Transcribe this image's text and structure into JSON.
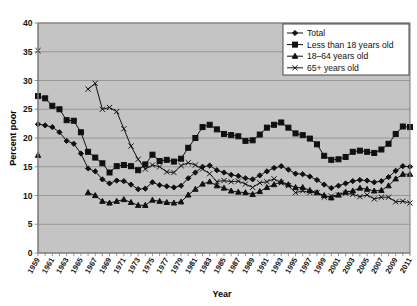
{
  "chart_data": {
    "type": "line",
    "title": "",
    "xlabel": "Year",
    "ylabel": "Percent poor",
    "ylim": [
      0,
      40
    ],
    "ytick_step": 5,
    "yticks": [
      0,
      5,
      10,
      15,
      20,
      25,
      30,
      35,
      40
    ],
    "xlim": [
      1959,
      2011
    ],
    "grid": "horizontal",
    "legend_position": "top-right",
    "plot_background": "#c4c4c4",
    "x": [
      1959,
      1960,
      1961,
      1962,
      1963,
      1964,
      1965,
      1966,
      1967,
      1968,
      1969,
      1970,
      1971,
      1972,
      1973,
      1974,
      1975,
      1976,
      1977,
      1978,
      1979,
      1980,
      1981,
      1982,
      1983,
      1984,
      1985,
      1986,
      1987,
      1988,
      1989,
      1990,
      1991,
      1992,
      1993,
      1994,
      1995,
      1996,
      1997,
      1998,
      1999,
      2000,
      2001,
      2002,
      2003,
      2004,
      2005,
      2006,
      2007,
      2008,
      2009,
      2010,
      2011
    ],
    "xtick_labels": [
      "1959",
      "1961",
      "1963",
      "1965",
      "1967",
      "1969",
      "1971",
      "1973",
      "1975",
      "1977",
      "1979",
      "1981",
      "1983",
      "1985",
      "1987",
      "1989",
      "1991",
      "1993",
      "1995",
      "1997",
      "1999",
      "2001",
      "2003",
      "2005",
      "2007",
      "2009",
      "2011"
    ],
    "series": [
      {
        "name": "Total",
        "marker": "diamond",
        "values": [
          22.4,
          22.2,
          21.9,
          21.0,
          19.5,
          19.0,
          17.3,
          14.7,
          14.2,
          12.8,
          12.1,
          12.6,
          12.5,
          11.9,
          11.1,
          11.2,
          12.3,
          11.8,
          11.6,
          11.4,
          11.7,
          13.0,
          14.0,
          15.0,
          15.2,
          14.4,
          14.0,
          13.6,
          13.4,
          13.0,
          12.8,
          13.5,
          14.2,
          14.8,
          15.1,
          14.5,
          13.8,
          13.7,
          13.3,
          12.7,
          11.9,
          11.3,
          11.7,
          12.1,
          12.5,
          12.7,
          12.6,
          12.3,
          12.5,
          13.2,
          14.3,
          15.1,
          15.0
        ]
      },
      {
        "name": "Less than 18 years old",
        "marker": "square",
        "values": [
          27.3,
          26.9,
          25.6,
          25.0,
          23.1,
          23.0,
          21.0,
          17.6,
          16.6,
          15.6,
          14.0,
          15.1,
          15.3,
          15.1,
          14.4,
          15.4,
          17.1,
          16.0,
          16.2,
          15.9,
          16.4,
          18.3,
          20.0,
          21.9,
          22.3,
          21.5,
          20.7,
          20.5,
          20.3,
          19.5,
          19.6,
          20.6,
          21.8,
          22.3,
          22.7,
          21.8,
          20.8,
          20.5,
          19.9,
          18.9,
          16.9,
          16.2,
          16.3,
          16.7,
          17.6,
          17.8,
          17.6,
          17.4,
          18.0,
          19.0,
          20.7,
          22.0,
          21.9
        ]
      },
      {
        "name": "18–64 years old",
        "marker": "triangle",
        "values": [
          17.0,
          null,
          null,
          null,
          null,
          null,
          null,
          10.5,
          10.0,
          9.0,
          8.7,
          9.0,
          9.3,
          8.8,
          8.3,
          8.3,
          9.2,
          9.0,
          8.8,
          8.7,
          8.9,
          10.1,
          11.1,
          12.0,
          12.4,
          11.7,
          11.3,
          10.8,
          10.6,
          10.5,
          10.2,
          10.7,
          11.4,
          11.9,
          12.4,
          11.9,
          11.4,
          11.4,
          10.9,
          10.5,
          10.0,
          9.6,
          10.1,
          10.6,
          10.8,
          11.3,
          11.1,
          10.8,
          10.9,
          11.7,
          12.9,
          13.7,
          13.7
        ]
      },
      {
        "name": "65+ years old",
        "marker": "x",
        "values": [
          35.2,
          null,
          null,
          null,
          null,
          null,
          null,
          28.5,
          29.5,
          25.0,
          25.3,
          24.6,
          21.6,
          18.6,
          16.3,
          14.6,
          15.3,
          15.0,
          14.1,
          14.0,
          15.2,
          15.7,
          15.3,
          14.6,
          13.8,
          12.4,
          12.6,
          12.4,
          12.5,
          12.0,
          11.4,
          12.2,
          12.4,
          12.9,
          12.2,
          11.7,
          10.5,
          10.8,
          10.5,
          10.5,
          9.7,
          9.9,
          10.1,
          10.4,
          10.2,
          9.8,
          10.1,
          9.4,
          9.7,
          9.7,
          8.9,
          9.0,
          8.7
        ]
      }
    ]
  },
  "legend": {
    "entries": [
      {
        "label": "Total",
        "marker": "diamond"
      },
      {
        "label": "Less than 18 years old",
        "marker": "square"
      },
      {
        "label": "18–64 years old",
        "marker": "triangle"
      },
      {
        "label": "65+ years old",
        "marker": "x"
      }
    ]
  }
}
